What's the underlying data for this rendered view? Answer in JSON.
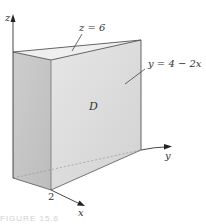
{
  "figure": {
    "axes": {
      "x_label": "x",
      "y_label": "y",
      "z_label": "z"
    },
    "annotations": {
      "top_plane": "z = 6",
      "slanted_plane": "y = 4 − 2x",
      "region": "D",
      "x_intercept": "2"
    },
    "caption": "FIGURE 15.6",
    "colors": {
      "face_left": "#c9c9c9",
      "face_front": "#dedede",
      "face_top": "#ececec",
      "edge": "#555555",
      "axis": "#333333",
      "background": "#ffffff"
    }
  }
}
